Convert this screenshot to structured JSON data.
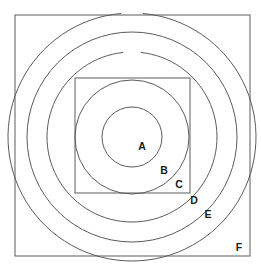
{
  "figure": {
    "background_color": "#ffffff",
    "stroke_color": "#5a5a5a",
    "label_color": "#1a1a1a",
    "center": {
      "x": 132,
      "y": 137
    },
    "shapes": [
      {
        "id": "A",
        "kind": "circle",
        "label": "A",
        "cx": 132,
        "cy": 137,
        "r": 30,
        "gap": false
      },
      {
        "id": "B",
        "kind": "circle",
        "label": "B",
        "cx": 132,
        "cy": 137,
        "r": 57,
        "gap": false
      },
      {
        "id": "C",
        "kind": "square",
        "label": "C",
        "x": 75,
        "y": 78,
        "width": 115,
        "height": 115
      },
      {
        "id": "D",
        "kind": "circle",
        "label": "D",
        "cx": 132,
        "cy": 137,
        "r": 85,
        "gap": true,
        "gap_start_deg": 264,
        "gap_end_deg": 276
      },
      {
        "id": "E",
        "kind": "circle",
        "label": "E",
        "cx": 132,
        "cy": 137,
        "r": 105,
        "gap": false
      },
      {
        "id": "F",
        "kind": "circle",
        "label": "F",
        "cx": 132,
        "cy": 137,
        "r": 124,
        "gap": true,
        "gap_start_deg": 265,
        "gap_end_deg": 275
      },
      {
        "id": "G",
        "kind": "square",
        "label": "",
        "x": 15,
        "y": 15,
        "width": 235,
        "height": 241
      }
    ],
    "labels": [
      {
        "text": "A",
        "x": 142,
        "y": 147
      },
      {
        "text": "B",
        "x": 164,
        "y": 171
      },
      {
        "text": "C",
        "x": 179,
        "y": 185
      },
      {
        "text": "D",
        "x": 194,
        "y": 201
      },
      {
        "text": "E",
        "x": 208,
        "y": 215
      },
      {
        "text": "F",
        "x": 239,
        "y": 248
      }
    ]
  }
}
